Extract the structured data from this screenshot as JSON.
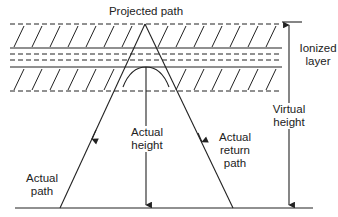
{
  "diagram": {
    "labels": {
      "projected_path": "Projected path",
      "ionized_layer": "Ionized\nlayer",
      "virtual_height": "Virtual\nheight",
      "actual_height": "Actual\nheight",
      "actual_path": "Actual\npath",
      "actual_return_path": "Actual\nreturn\npath"
    },
    "colors": {
      "line": "#222222",
      "background": "#ffffff"
    }
  }
}
